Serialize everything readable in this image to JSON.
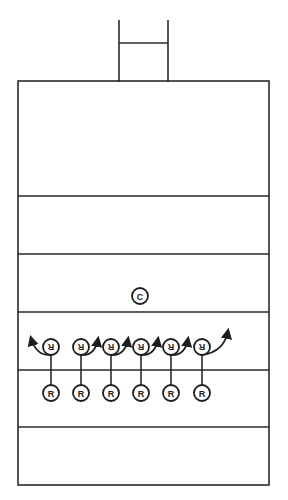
{
  "diagram": {
    "title": "",
    "colors": {
      "line": "#2a2a2a",
      "background": "#ffffff"
    },
    "goalpost": {
      "label": "goalpost"
    },
    "field_lines": {
      "count": 5,
      "label": "yard-lines"
    },
    "center": {
      "label": "C"
    },
    "top_row": {
      "orientation": "upside-down",
      "players": [
        {
          "label": "R",
          "arrow": "left"
        },
        {
          "label": "R",
          "arrow": "right"
        },
        {
          "label": "R",
          "arrow": "right"
        },
        {
          "label": "R",
          "arrow": "right"
        },
        {
          "label": "R",
          "arrow": "right"
        },
        {
          "label": "R",
          "arrow": "right-long"
        }
      ]
    },
    "bottom_row": {
      "players": [
        {
          "label": "R"
        },
        {
          "label": "R"
        },
        {
          "label": "R"
        },
        {
          "label": "R"
        },
        {
          "label": "R"
        },
        {
          "label": "R"
        }
      ]
    }
  }
}
